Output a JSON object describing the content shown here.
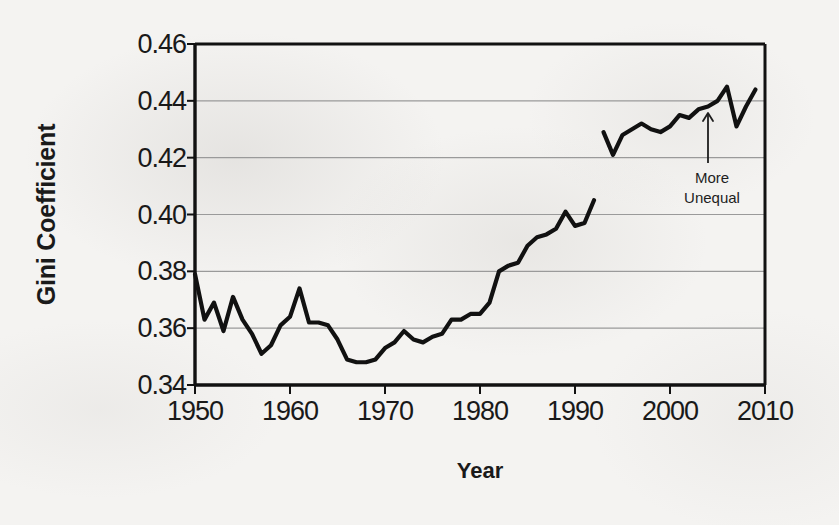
{
  "figure": {
    "background_color": "#f4f3f1",
    "line_color": "#111111",
    "grid_color": "#9a9a9a",
    "axis_color": "#111111"
  },
  "annotation": {
    "line1": "More",
    "line2": "Unequal",
    "arrow_name": "up-arrow-annotation"
  },
  "chart_data": {
    "type": "line",
    "title": "",
    "xlabel": "Year",
    "ylabel": "Gini Coefficient",
    "xlim": [
      1950,
      2010
    ],
    "ylim": [
      0.34,
      0.46
    ],
    "grid": true,
    "grid_axis": "y",
    "legend": "none",
    "xticks": [
      1950,
      1960,
      1970,
      1980,
      1990,
      2000,
      2010
    ],
    "xtick_labels": [
      "1950",
      "1960",
      "1970",
      "1980",
      "1990",
      "2000",
      "2010"
    ],
    "yticks": [
      0.34,
      0.36,
      0.38,
      0.4,
      0.42,
      0.44,
      0.46
    ],
    "ytick_labels": [
      "0.34",
      "0.36",
      "0.38",
      "0.40",
      "0.42",
      "0.44",
      "0.46"
    ],
    "annotations": [
      {
        "text": "More Unequal",
        "x": 2004,
        "y": 0.405,
        "arrow": "up"
      }
    ],
    "series": [
      {
        "name": "Gini coefficient 1950-1992",
        "x": [
          1950,
          1951,
          1952,
          1953,
          1954,
          1955,
          1956,
          1957,
          1958,
          1959,
          1960,
          1961,
          1962,
          1963,
          1964,
          1965,
          1966,
          1967,
          1968,
          1969,
          1970,
          1971,
          1972,
          1973,
          1974,
          1975,
          1976,
          1977,
          1978,
          1979,
          1980,
          1981,
          1982,
          1983,
          1984,
          1985,
          1986,
          1987,
          1988,
          1989,
          1990,
          1991,
          1992
        ],
        "values": [
          0.379,
          0.363,
          0.369,
          0.359,
          0.371,
          0.363,
          0.358,
          0.351,
          0.354,
          0.361,
          0.364,
          0.374,
          0.362,
          0.362,
          0.361,
          0.356,
          0.349,
          0.348,
          0.348,
          0.349,
          0.353,
          0.355,
          0.359,
          0.356,
          0.355,
          0.357,
          0.358,
          0.363,
          0.363,
          0.365,
          0.365,
          0.369,
          0.38,
          0.382,
          0.383,
          0.389,
          0.392,
          0.393,
          0.395,
          0.401,
          0.396,
          0.397,
          0.405
        ]
      },
      {
        "name": "Gini coefficient 1993-2009",
        "x": [
          1993,
          1994,
          1995,
          1996,
          1997,
          1998,
          1999,
          2000,
          2001,
          2002,
          2003,
          2004,
          2005,
          2006,
          2007,
          2008,
          2009
        ],
        "values": [
          0.429,
          0.421,
          0.428,
          0.43,
          0.432,
          0.43,
          0.429,
          0.431,
          0.435,
          0.434,
          0.437,
          0.438,
          0.44,
          0.445,
          0.431,
          0.438,
          0.444
        ]
      }
    ]
  }
}
